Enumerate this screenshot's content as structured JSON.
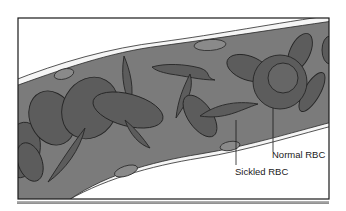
{
  "figure": {
    "labels": {
      "normal": "Normal RBC",
      "sickled": "Sickled RBC"
    },
    "colors": {
      "background": "#ffffff",
      "vessel_lumen": "#7b7b7b",
      "vessel_wall": "#f4f4f4",
      "endothelial_nucleus": "#8a8a8a",
      "cell_fill": "#5c5c5c",
      "cell_outline": "#262626",
      "frame": "#1a1a1a",
      "footer_bar": "#9a9a9a"
    }
  }
}
